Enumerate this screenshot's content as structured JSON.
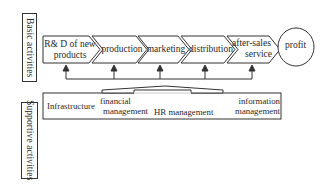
{
  "diagram": {
    "type": "value chain",
    "labels": {
      "basic_activities": "Basic activities",
      "supportive_activities": "Supportive activities"
    },
    "primary_activities": [
      {
        "line1": "R& D of new",
        "line2": "products"
      },
      {
        "line1": "production",
        "line2": ""
      },
      {
        "line1": "marketing",
        "line2": ""
      },
      {
        "line1": "distribution",
        "line2": ""
      },
      {
        "line1": "after-sales",
        "line2": "service"
      }
    ],
    "outcome": "profit",
    "support_activities": [
      {
        "line1": "Infrastructure",
        "line2": ""
      },
      {
        "line1": "financial",
        "line2": "management"
      },
      {
        "line1": "HR management",
        "line2": ""
      },
      {
        "line1": "information",
        "line2": "management"
      }
    ],
    "colors": {
      "stroke": "#333333",
      "background": "#ffffff",
      "text": "#2a2a2a"
    }
  }
}
